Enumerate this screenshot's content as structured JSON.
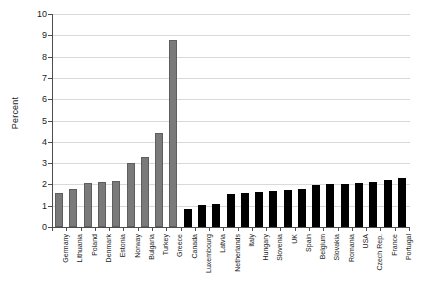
{
  "chart_data": {
    "type": "bar",
    "title": "",
    "subtitle": "",
    "xlabel": "",
    "ylabel": "Percent",
    "ylim": [
      0,
      10
    ],
    "ytick_labels": [
      "0",
      "1",
      "2",
      "3",
      "4",
      "5",
      "6",
      "7",
      "8",
      "9",
      "10"
    ],
    "ytick_values": [
      0,
      1,
      2,
      3,
      4,
      5,
      6,
      7,
      8,
      9,
      10
    ],
    "grid": true,
    "legend": "none",
    "categories": [
      "Germany",
      "Lithuania",
      "Poland",
      "Denmark",
      "Estonia",
      "Norway",
      "Bulgaria",
      "Turkey",
      "Greece",
      "Canada",
      "Luxembourg",
      "Latvia",
      "Netherlands",
      "Italy",
      "Hungary",
      "Slovenia",
      "UK",
      "Spain",
      "Belgium",
      "Slovakia",
      "Romania",
      "USA",
      "Czech Rep.",
      "France",
      "Portugal"
    ],
    "values": [
      1.6,
      1.8,
      2.05,
      2.1,
      2.15,
      3.0,
      3.3,
      4.4,
      8.8,
      0.85,
      1.05,
      1.1,
      1.55,
      1.6,
      1.65,
      1.7,
      1.75,
      1.8,
      1.95,
      2.0,
      2.0,
      2.05,
      2.1,
      2.2,
      2.3
    ],
    "bar_colors": [
      "#7a7a7a",
      "#7a7a7a",
      "#7a7a7a",
      "#7a7a7a",
      "#7a7a7a",
      "#7a7a7a",
      "#7a7a7a",
      "#7a7a7a",
      "#7a7a7a",
      "#000000",
      "#000000",
      "#000000",
      "#000000",
      "#000000",
      "#000000",
      "#000000",
      "#000000",
      "#000000",
      "#000000",
      "#000000",
      "#000000",
      "#000000",
      "#000000",
      "#000000",
      "#000000"
    ],
    "colors": {
      "series_a": "#7a7a7a",
      "series_b": "#000000",
      "grid": "#d9d9d9",
      "axis": "#4d4d4d",
      "text": "#1a1a1a",
      "background": "#ffffff"
    }
  }
}
